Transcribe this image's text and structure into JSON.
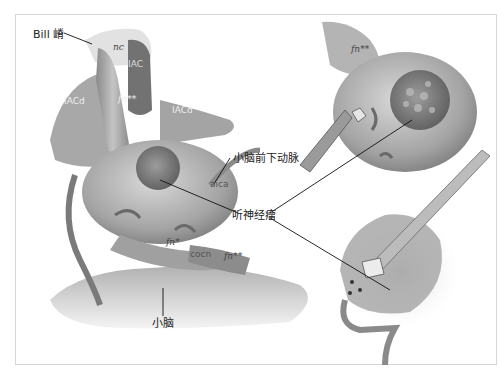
{
  "figure": {
    "callouts": {
      "bill_bar": "Bill 嵴",
      "aica": "小脑前下动脉",
      "acoustic_neuroma": "听神经瘤",
      "cerebellum": "小脑"
    },
    "inline_labels": {
      "nc": "nc",
      "iac": "IAC",
      "iacd_left": "IACd",
      "iacd_right": "IACd",
      "fn_top": "fn**",
      "aica_abbr": "aica",
      "fn_mid": "fn*",
      "cocn": "cocn",
      "fn_bottom": "fn**",
      "fn_panel_top_right": "fn**"
    },
    "panels": [
      "left-main-view",
      "top-right-tumor-exposure",
      "bottom-right-tumor-removal"
    ],
    "colors": {
      "frame_border": "#d6d6d6",
      "tissue": "#9a9a9a",
      "tissue_dark": "#6e6e6e",
      "leader_line": "#111111"
    }
  }
}
